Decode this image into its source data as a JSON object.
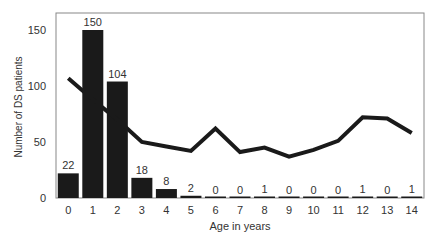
{
  "chart_data": {
    "type": "bar",
    "title": "",
    "xlabel": "Age in years",
    "ylabel": "Number of DS patients",
    "categories": [
      "0",
      "1",
      "2",
      "3",
      "4",
      "5",
      "6",
      "7",
      "8",
      "9",
      "10",
      "11",
      "12",
      "13",
      "14"
    ],
    "ylim": [
      0,
      160
    ],
    "yticks": [
      0,
      50,
      100,
      150
    ],
    "grid": false,
    "series": [
      {
        "name": "DS patients",
        "type": "bar",
        "color": "#1a1a1a",
        "values": [
          22,
          150,
          104,
          18,
          8,
          2,
          0,
          0,
          1,
          0,
          0,
          0,
          1,
          0,
          1
        ],
        "data_labels": [
          "22",
          "150",
          "104",
          "18",
          "8",
          "2",
          "0",
          "0",
          "1",
          "0",
          "0",
          "0",
          "1",
          "0",
          "1"
        ]
      },
      {
        "name": "Trend line",
        "type": "line",
        "color": "#1a1a1a",
        "values": [
          107,
          88,
          70,
          50,
          46,
          42,
          62,
          41,
          45,
          37,
          43,
          51,
          72,
          71,
          58
        ]
      }
    ]
  }
}
